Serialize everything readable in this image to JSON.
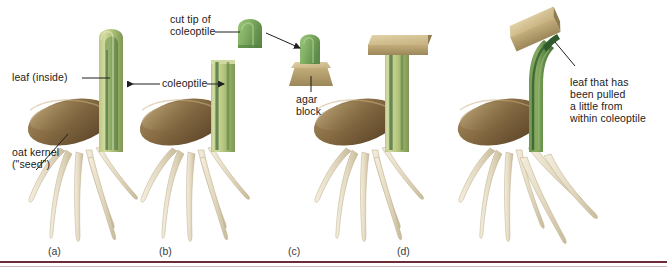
{
  "figure": {
    "background": "#ffffff",
    "rule_color": "#6e2b38"
  },
  "labels": {
    "leaf_inside": "leaf (inside)",
    "coleoptile": "coleoptile",
    "cut_tip": "cut tip of\ncoleoptile",
    "cut_tip_line1": "cut tip of",
    "cut_tip_line2": "coleoptile",
    "agar_block": "agar\nblock",
    "agar_block_line1": "agar",
    "agar_block_line2": "block",
    "oat_kernel": "oat kernel\n(\"seed\")",
    "oat_kernel_line1": "oat kernel",
    "oat_kernel_line2": "(\"seed\")",
    "leaf_pulled_line1": "leaf that has",
    "leaf_pulled_line2": "been pulled",
    "leaf_pulled_line3": "a little from",
    "leaf_pulled_line4": "within coleoptile"
  },
  "panels": [
    {
      "id": "a",
      "letter": "(a)",
      "description": "intact seedling with whole coleoptile and leaf inside"
    },
    {
      "id": "b",
      "letter": "(b)",
      "description": "coleoptile tip cut off, tip placed on agar block"
    },
    {
      "id": "c",
      "letter": "(c)",
      "description": "agar block placed flat on cut coleoptile stump"
    },
    {
      "id": "d",
      "letter": "(d)",
      "description": "agar block placed off-center, coleoptile bends"
    }
  ],
  "colors": {
    "coleoptile_light": "#c3cf8e",
    "coleoptile_mid": "#a9bd72",
    "leaf_dark_green": "#4e7a42",
    "leaf_mid_green": "#6f9a55",
    "tip_green": "#7fb060",
    "kernel_dark": "#6b5334",
    "kernel_mid": "#8d7048",
    "kernel_light": "#b39a6c",
    "root_light": "#efe7d3",
    "root_shadow": "#cfc3a6",
    "agar_light": "#d8c79a",
    "agar_mid": "#bfa871",
    "agar_dark": "#a08c5c",
    "leader_line": "#2b2b2b"
  }
}
